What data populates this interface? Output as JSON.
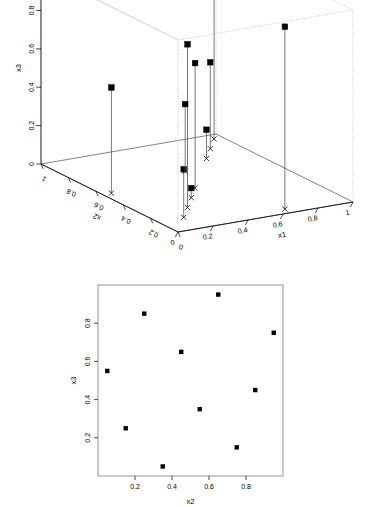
{
  "figure": {
    "width": 373,
    "height": 507,
    "background": "#ffffff",
    "foreground": "#000000"
  },
  "chart_data": [
    {
      "type": "scatter",
      "id": "scatterplot3d",
      "title": "",
      "xlabel": "x1",
      "ylabel": "x2",
      "zlabel": "x3",
      "xlim": [
        0,
        1
      ],
      "ylim": [
        0,
        1
      ],
      "zlim": [
        0,
        1
      ],
      "xticks": [
        "0",
        "0.2",
        "0.4",
        "0.6",
        "0.8",
        "1"
      ],
      "yticks": [
        "0",
        "0.2",
        "0.4",
        "0.6",
        "0.8",
        "1"
      ],
      "zticks": [
        "0",
        "0.2",
        "0.4",
        "0.6",
        "0.8",
        "1"
      ],
      "grid": false,
      "legend": "none",
      "marker": "filled-square",
      "base_marker": "x-cross",
      "droplines": true,
      "points": [
        {
          "x1": 0.05,
          "x2": 0.55,
          "x3": 0.55
        },
        {
          "x1": 0.15,
          "x2": 0.15,
          "x3": 0.25
        },
        {
          "x1": 0.25,
          "x2": 0.25,
          "x3": 0.85
        },
        {
          "x1": 0.35,
          "x2": 0.35,
          "x3": 0.05
        },
        {
          "x1": 0.45,
          "x2": 0.45,
          "x3": 0.65
        },
        {
          "x1": 0.55,
          "x2": 0.65,
          "x3": 0.35
        },
        {
          "x1": 0.65,
          "x2": 0.05,
          "x3": 0.95
        },
        {
          "x1": 0.75,
          "x2": 0.75,
          "x3": 0.15
        },
        {
          "x1": 0.85,
          "x2": 0.85,
          "x3": 0.45
        },
        {
          "x1": 0.95,
          "x2": 0.95,
          "x3": 0.75
        }
      ]
    },
    {
      "type": "scatter",
      "id": "scatter2d-x3-vs-x2",
      "title": "",
      "xlabel": "x2",
      "ylabel": "x3",
      "xlim": [
        0,
        1
      ],
      "ylim": [
        0,
        1
      ],
      "xticks": [
        "0.2",
        "0.4",
        "0.6",
        "0.8"
      ],
      "xtickvalues": [
        0.2,
        0.4,
        0.6,
        0.8
      ],
      "yticks": [
        "0.2",
        "0.4",
        "0.6",
        "0.8"
      ],
      "ytickvalues": [
        0.2,
        0.4,
        0.6,
        0.8
      ],
      "grid": false,
      "legend": "none",
      "marker": "filled-square",
      "x": [
        0.05,
        0.15,
        0.25,
        0.35,
        0.45,
        0.55,
        0.65,
        0.75,
        0.85,
        0.95
      ],
      "y": [
        0.55,
        0.25,
        0.85,
        0.05,
        0.65,
        0.35,
        0.95,
        0.15,
        0.45,
        0.75
      ]
    }
  ],
  "plot3d": {
    "name": "3d-scatter-plot",
    "axis_titles": {
      "x": "x1",
      "y": "x2",
      "z": "x3"
    },
    "z_tick_labels": [
      "0",
      "0.2",
      "0.4",
      "0.6",
      "0.8",
      "1"
    ],
    "x_tick_labels": [
      "0",
      "0.2",
      "0.4",
      "0.6",
      "0.8",
      "1"
    ],
    "y_tick_labels": [
      "0",
      "0.2",
      "0.4",
      "0.6",
      "0.8",
      "1"
    ]
  },
  "plot2d": {
    "name": "2d-scatter-plot",
    "axis_titles": {
      "x": "x2",
      "y": "x3"
    },
    "x_tick_labels": [
      "0.2",
      "0.4",
      "0.6",
      "0.8"
    ],
    "y_tick_labels": [
      "0.2",
      "0.4",
      "0.6",
      "0.8"
    ]
  }
}
